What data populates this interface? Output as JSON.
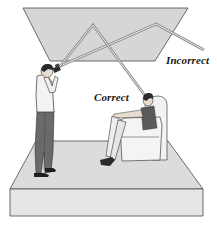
{
  "diagram": {
    "type": "illustration",
    "labels": {
      "incorrect": "Incorrect",
      "correct": "Correct"
    },
    "elements": {
      "ceiling": "reflective ceiling plane",
      "floor": "room floor platform",
      "photographer": "standing person holding camera with flash",
      "subject": "seated person in armchair",
      "beam_correct": "light path reflecting from ceiling down to seated subject",
      "beam_incorrect": "light path reflecting from ceiling away past subject"
    },
    "colors": {
      "ceiling_fill": "#d6d6d6",
      "floor_top": "#dcdcdc",
      "floor_front": "#e4e4e4",
      "outline": "#3a3a3a",
      "beam": "#9a9a9a",
      "clothing_dark": "#555555",
      "chair": "#f2f2f2"
    }
  }
}
